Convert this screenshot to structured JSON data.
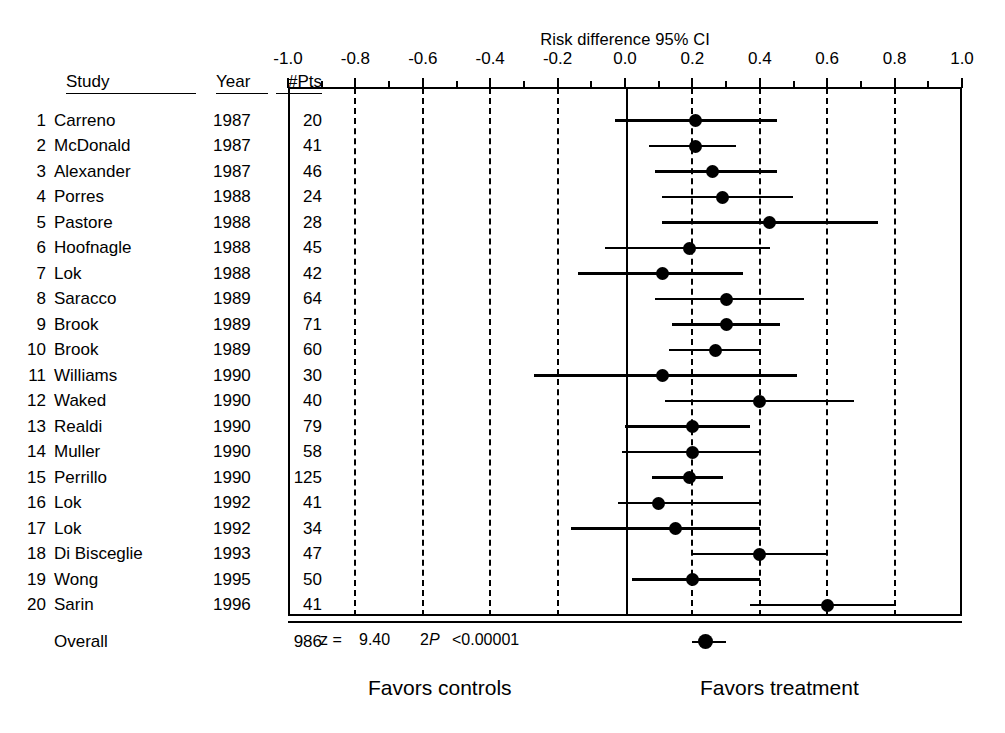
{
  "chart_data": {
    "type": "forest",
    "title": "Risk difference 95% CI",
    "xlabel": "",
    "ylabel": "",
    "xlim": [
      -1.0,
      1.0
    ],
    "xticks": [
      "-1.0",
      "-0.8",
      "-0.6",
      "-0.4",
      "-0.2",
      "0.0",
      "0.2",
      "0.4",
      "0.6",
      "0.8",
      "1.0"
    ],
    "xtick_values": [
      -1.0,
      -0.8,
      -0.6,
      -0.4,
      -0.2,
      0.0,
      0.2,
      0.4,
      0.6,
      0.8,
      1.0
    ],
    "minor_tick_values": [
      -0.9,
      -0.7,
      -0.5,
      -0.3,
      -0.1,
      0.1,
      0.3,
      0.5,
      0.7,
      0.9
    ],
    "gridlines_dashed_at": [
      -0.8,
      -0.6,
      -0.4,
      -0.2,
      0.2,
      0.4,
      0.6,
      0.8
    ],
    "zero_line_at": 0.0,
    "grid": true,
    "legend": "none",
    "columns": [
      "Study",
      "Year",
      "#Pts"
    ],
    "left_annotation": "Favors controls",
    "right_annotation": "Favors treatment",
    "rows": [
      {
        "n": "1",
        "study": "Carreno",
        "year": "1987",
        "pts": "20",
        "estimate": 0.21,
        "ci_low": -0.03,
        "ci_high": 0.45
      },
      {
        "n": "2",
        "study": "McDonald",
        "year": "1987",
        "pts": "41",
        "estimate": 0.21,
        "ci_low": 0.07,
        "ci_high": 0.33
      },
      {
        "n": "3",
        "study": "Alexander",
        "year": "1987",
        "pts": "46",
        "estimate": 0.26,
        "ci_low": 0.09,
        "ci_high": 0.45
      },
      {
        "n": "4",
        "study": "Porres",
        "year": "1988",
        "pts": "24",
        "estimate": 0.29,
        "ci_low": 0.11,
        "ci_high": 0.5
      },
      {
        "n": "5",
        "study": "Pastore",
        "year": "1988",
        "pts": "28",
        "estimate": 0.43,
        "ci_low": 0.11,
        "ci_high": 0.75
      },
      {
        "n": "6",
        "study": "Hoofnagle",
        "year": "1988",
        "pts": "45",
        "estimate": 0.19,
        "ci_low": -0.06,
        "ci_high": 0.43
      },
      {
        "n": "7",
        "study": "Lok",
        "year": "1988",
        "pts": "42",
        "estimate": 0.11,
        "ci_low": -0.14,
        "ci_high": 0.35
      },
      {
        "n": "8",
        "study": "Saracco",
        "year": "1989",
        "pts": "64",
        "estimate": 0.3,
        "ci_low": 0.09,
        "ci_high": 0.53
      },
      {
        "n": "9",
        "study": "Brook",
        "year": "1989",
        "pts": "71",
        "estimate": 0.3,
        "ci_low": 0.14,
        "ci_high": 0.46
      },
      {
        "n": "10",
        "study": "Brook",
        "year": "1989",
        "pts": "60",
        "estimate": 0.27,
        "ci_low": 0.13,
        "ci_high": 0.4
      },
      {
        "n": "11",
        "study": "Williams",
        "year": "1990",
        "pts": "30",
        "estimate": 0.11,
        "ci_low": -0.27,
        "ci_high": 0.51
      },
      {
        "n": "12",
        "study": "Waked",
        "year": "1990",
        "pts": "40",
        "estimate": 0.4,
        "ci_low": 0.12,
        "ci_high": 0.68
      },
      {
        "n": "13",
        "study": "Realdi",
        "year": "1990",
        "pts": "79",
        "estimate": 0.2,
        "ci_low": 0.0,
        "ci_high": 0.37
      },
      {
        "n": "14",
        "study": "Muller",
        "year": "1990",
        "pts": "58",
        "estimate": 0.2,
        "ci_low": -0.01,
        "ci_high": 0.4
      },
      {
        "n": "15",
        "study": "Perrillo",
        "year": "1990",
        "pts": "125",
        "estimate": 0.19,
        "ci_low": 0.08,
        "ci_high": 0.29
      },
      {
        "n": "16",
        "study": "Lok",
        "year": "1992",
        "pts": "41",
        "estimate": 0.1,
        "ci_low": -0.02,
        "ci_high": 0.4
      },
      {
        "n": "17",
        "study": "Lok",
        "year": "1992",
        "pts": "34",
        "estimate": 0.15,
        "ci_low": -0.16,
        "ci_high": 0.4
      },
      {
        "n": "18",
        "study": "Di Bisceglie",
        "year": "1993",
        "pts": "47",
        "estimate": 0.4,
        "ci_low": 0.2,
        "ci_high": 0.6
      },
      {
        "n": "19",
        "study": "Wong",
        "year": "1995",
        "pts": "50",
        "estimate": 0.2,
        "ci_low": 0.02,
        "ci_high": 0.4
      },
      {
        "n": "20",
        "study": "Sarin",
        "year": "1996",
        "pts": "41",
        "estimate": 0.6,
        "ci_low": 0.37,
        "ci_high": 0.8
      }
    ],
    "overall": {
      "label": "Overall",
      "pts": "986",
      "estimate": 0.24,
      "ci_low": 0.2,
      "ci_high": 0.3
    },
    "statistics": {
      "z_label": "z  =",
      "z_value": "9.40",
      "p_label_prefix": "2",
      "p_label_italic": "P",
      "p_value": "<0.00001"
    }
  },
  "colors": {
    "ink": "#000000",
    "background": "#ffffff"
  }
}
